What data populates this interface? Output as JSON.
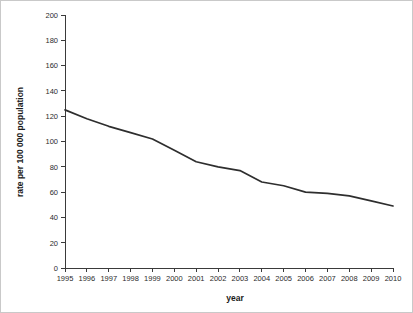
{
  "chart_data": {
    "type": "line",
    "title": "",
    "xlabel": "year",
    "ylabel": "rate per 100 000 population",
    "x": [
      1995,
      1996,
      1997,
      1998,
      1999,
      2000,
      2001,
      2002,
      2003,
      2004,
      2005,
      2006,
      2007,
      2008,
      2009,
      2010
    ],
    "categories": [
      "1995",
      "1996",
      "1997",
      "1998",
      "1999",
      "2000",
      "2001",
      "2002",
      "2003",
      "2004",
      "2005",
      "2006",
      "2007",
      "2008",
      "2009",
      "2010"
    ],
    "values": [
      125,
      118,
      112,
      107,
      102,
      93,
      84,
      80,
      77,
      68,
      65,
      60,
      59,
      57,
      53,
      49
    ],
    "series": [
      {
        "name": "rate per 100 000 population",
        "values": [
          125,
          118,
          112,
          107,
          102,
          93,
          84,
          80,
          77,
          68,
          65,
          60,
          59,
          57,
          53,
          49
        ]
      }
    ],
    "xlim": [
      1995,
      2010
    ],
    "ylim": [
      0,
      200
    ],
    "yticks": [
      0,
      20,
      40,
      60,
      80,
      100,
      120,
      140,
      160,
      180,
      200
    ],
    "ytick_labels": [
      "0",
      "20",
      "40",
      "60",
      "80",
      "100",
      "120",
      "140",
      "160",
      "180",
      "200"
    ],
    "xticks": [
      1995,
      1996,
      1997,
      1998,
      1999,
      2000,
      2001,
      2002,
      2003,
      2004,
      2005,
      2006,
      2007,
      2008,
      2009,
      2010
    ],
    "grid": false,
    "legend": false,
    "legend_position": "none",
    "line_color": "#2e2e2e",
    "axis_color": "#3a3a3a",
    "background_color": "#ffffff",
    "border_color": "#c9c9c9"
  }
}
